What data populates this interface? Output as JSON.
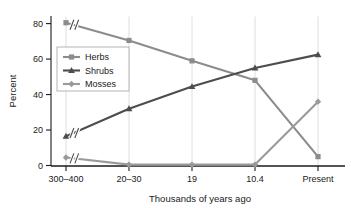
{
  "chart_data": {
    "type": "line",
    "title": "",
    "xlabel": "Thousands of years ago",
    "ylabel": "Percent",
    "categories": [
      "300–400",
      "20–30",
      "19",
      "10.4",
      "Present"
    ],
    "yticks": [
      0,
      20,
      40,
      60,
      80
    ],
    "ylim": [
      0,
      84
    ],
    "grid": "vertical-only",
    "axis_break": "Axis break marks (//) drawn on each series between the first and second categories",
    "legend_position": "upper-left inside plot",
    "series": [
      {
        "name": "Herbs",
        "marker": "square",
        "color": "#8c8c8c",
        "values": [
          80.5,
          70.5,
          59,
          48,
          5
        ]
      },
      {
        "name": "Shrubs",
        "marker": "triangle",
        "color": "#4d4d4d",
        "values": [
          16.5,
          32,
          44.5,
          55,
          62.5
        ]
      },
      {
        "name": "Mosses",
        "marker": "diamond",
        "color": "#9a9a9a",
        "values": [
          4.5,
          0.5,
          0.5,
          0.5,
          36
        ]
      }
    ]
  },
  "legend": {
    "items": [
      {
        "label": "Herbs"
      },
      {
        "label": "Shrubs"
      },
      {
        "label": "Mosses"
      }
    ]
  },
  "axes": {
    "y_title": "Percent",
    "x_title": "Thousands of years ago",
    "y_tick_labels": [
      "0",
      "20",
      "40",
      "60",
      "80"
    ],
    "x_tick_labels": [
      "300–400",
      "20–30",
      "19",
      "10.4",
      "Present"
    ]
  },
  "colors": {
    "herbs": "#8c8c8c",
    "shrubs": "#4d4d4d",
    "mosses": "#9a9a9a",
    "axis": "#1a1a1a",
    "gridline": "#dedede",
    "background": "#ffffff"
  }
}
